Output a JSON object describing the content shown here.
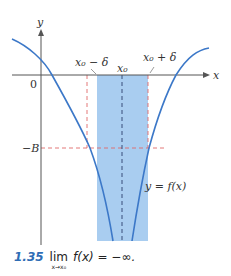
{
  "figure": {
    "axis_labels": {
      "x": "x",
      "y": "y",
      "origin": "0"
    },
    "annotations": {
      "x0_minus_delta": "x₀ − δ",
      "x0": "x₀",
      "x0_plus_delta": "x₀ + δ",
      "neg_B": "−B",
      "curve_label": "y = f(x)"
    },
    "colors": {
      "curve": "#3c78c8",
      "shade": "#a9cdf0",
      "red_dash": "#e06a6a",
      "center_dash": "#2b3f6b",
      "axis": "#555555"
    }
  },
  "caption": {
    "number": "1.35",
    "lim_word": "lim",
    "lim_sub": "x→x₀",
    "expression": "f(x) = −∞."
  }
}
